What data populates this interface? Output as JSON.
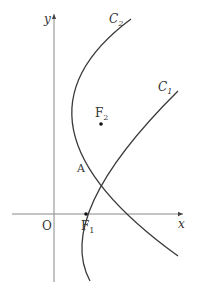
{
  "diagram": {
    "type": "coordinate-geometry",
    "axes": {
      "x_label": "x",
      "y_label": "y",
      "origin_label": "O"
    },
    "curves": [
      {
        "id": "C1",
        "label": "C",
        "subscript": "1",
        "kind": "parabola",
        "vertex": "O",
        "opens": "right"
      },
      {
        "id": "C2",
        "label": "C",
        "subscript": "2",
        "kind": "parabola",
        "opens": "right"
      }
    ],
    "points": [
      {
        "id": "A",
        "label": "A",
        "description": "intersection of C1 and C2"
      },
      {
        "id": "F1",
        "label": "F",
        "subscript": "1",
        "description": "focus of C1 on x-axis"
      },
      {
        "id": "F2",
        "label": "F",
        "subscript": "2",
        "description": "focus of C2"
      }
    ]
  }
}
